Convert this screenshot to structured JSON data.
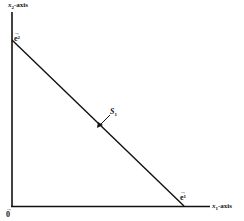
{
  "diagram": {
    "axes": {
      "vertical": {
        "var": "x",
        "sub": "2",
        "suffix": "-axis"
      },
      "horizontal": {
        "var": "x",
        "sub": "1",
        "suffix": "-axis"
      }
    },
    "points": {
      "origin": {
        "label": "0",
        "arrow": "→"
      },
      "e2": {
        "label": "e",
        "sup": "2",
        "arrow": "→"
      },
      "e1": {
        "label": "e",
        "sup": "1",
        "arrow": "→"
      }
    },
    "line": {
      "label": "S",
      "sub": "1"
    },
    "colors": {
      "ink": "#111111",
      "background": "#ffffff"
    }
  }
}
